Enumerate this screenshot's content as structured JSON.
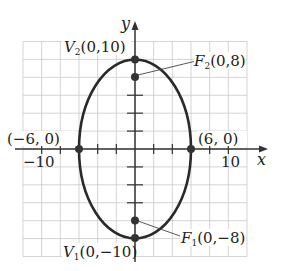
{
  "diagram": {
    "type": "ellipse-graph",
    "axes": {
      "x_label": "x",
      "y_label": "y",
      "x_tick_labels": [
        {
          "value": -10,
          "text": "−10"
        },
        {
          "value": 10,
          "text": "10"
        }
      ],
      "grid_step": 2,
      "x_range": [
        -12,
        12
      ],
      "y_range": [
        -12,
        12
      ]
    },
    "ellipse": {
      "center": [
        0,
        0
      ],
      "semi_major_vertical": 10,
      "semi_minor_horizontal": 6
    },
    "points": [
      {
        "id": "V2",
        "name": "V",
        "sub": "2",
        "coords": "(0,10)",
        "x": 0,
        "y": 10
      },
      {
        "id": "F2",
        "name": "F",
        "sub": "2",
        "coords": "(0,8)",
        "x": 0,
        "y": 8
      },
      {
        "id": "F1",
        "name": "F",
        "sub": "1",
        "coords": "(0,−8)",
        "x": 0,
        "y": -8
      },
      {
        "id": "V1",
        "name": "V",
        "sub": "1",
        "coords": "(0,−10)",
        "x": 0,
        "y": -10
      },
      {
        "id": "left",
        "coords": "(−6, 0)",
        "x": -6,
        "y": 0
      },
      {
        "id": "right",
        "coords": "(6, 0)",
        "x": 6,
        "y": 0
      }
    ],
    "colors": {
      "grid": "#c9c9c9",
      "axis": "#333333",
      "curve": "#2a2a2a",
      "point": "#333333",
      "text": "#222222"
    }
  }
}
